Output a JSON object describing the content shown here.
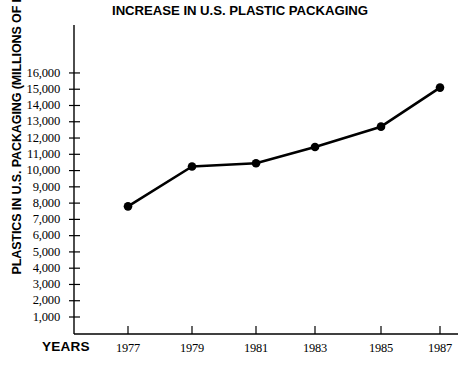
{
  "chart_data": {
    "type": "line",
    "title": "INCREASE IN U.S. PLASTIC PACKAGING",
    "xlabel": "YEARS",
    "ylabel": "PLASTICS IN U.S. PACKAGING (MILLIONS OF POUNDS)",
    "categories": [
      "1977",
      "1979",
      "1981",
      "1983",
      "1985",
      "1987"
    ],
    "x": [
      1977,
      1979,
      1981,
      1983,
      1985,
      1987
    ],
    "values": [
      7800,
      10250,
      10450,
      11450,
      12700,
      15100
    ],
    "series": [
      {
        "name": "Plastics in U.S. packaging",
        "values": [
          7800,
          10250,
          10450,
          11450,
          12700,
          15100
        ]
      }
    ],
    "ytick_labels": [
      "16,000",
      "15,000",
      "14,000",
      "13,000",
      "12,000",
      "11,000",
      "10,000",
      "9,000",
      "8,000",
      "7,000",
      "6,000",
      "5,000",
      "4,000",
      "3,000",
      "2,000",
      "1,000"
    ],
    "ytick_values": [
      16000,
      15000,
      14000,
      13000,
      12000,
      11000,
      10000,
      9000,
      8000,
      7000,
      6000,
      5000,
      4000,
      3000,
      2000,
      1000
    ],
    "ylim": [
      0,
      17500
    ],
    "xlim": [
      1976,
      1988
    ],
    "grid": false,
    "legend": "none",
    "line_color": "#000000",
    "marker": "circle",
    "marker_color": "#000000",
    "axis_color": "#000000",
    "background": "#ffffff"
  }
}
